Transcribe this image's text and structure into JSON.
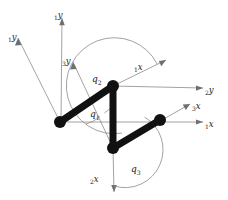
{
  "figure": {
    "kind": "kinematic-linkage-diagram",
    "background_color": "#ffffff",
    "link_color": "#111111",
    "axis_color": "#8a8a8a",
    "label_color": "#1a1a1a"
  },
  "joints": [
    {
      "name": "joint-left",
      "label": "",
      "x": 60,
      "y": 122
    },
    {
      "name": "joint-top",
      "label": "",
      "x": 113,
      "y": 86
    },
    {
      "name": "joint-bottom",
      "label": "",
      "x": 113,
      "y": 148
    },
    {
      "name": "joint-right",
      "label": "",
      "x": 160,
      "y": 120
    }
  ],
  "links": [
    {
      "name": "link-left-top",
      "from": "joint-left",
      "to": "joint-top"
    },
    {
      "name": "link-top-bottom",
      "from": "joint-top",
      "to": "joint-bottom"
    },
    {
      "name": "link-bottom-right",
      "from": "joint-bottom",
      "to": "joint-right"
    }
  ],
  "axes": [
    {
      "name": "axis-1y-diagonal",
      "sub": "1",
      "var": "y",
      "origin_x": 60,
      "origin_y": 122,
      "tip_x": 18,
      "tip_y": 38,
      "label_x": 8,
      "label_y": 34
    },
    {
      "name": "axis-1y-vertical",
      "sub": "1",
      "var": "y",
      "origin_x": 61,
      "origin_y": 122,
      "tip_x": 62,
      "tip_y": 18,
      "label_x": 56,
      "label_y": 14
    },
    {
      "name": "axis-3y",
      "sub": "3",
      "var": "y",
      "origin_x": 113,
      "origin_y": 148,
      "tip_x": 73,
      "tip_y": 62,
      "label_x": 64,
      "label_y": 58
    },
    {
      "name": "axis-1x-diagonal",
      "sub": "1",
      "var": "x",
      "origin_x": 113,
      "origin_y": 86,
      "tip_x": 166,
      "tip_y": 60,
      "label_x": 136,
      "label_y": 70
    },
    {
      "name": "axis-2y",
      "sub": "2",
      "var": "y",
      "origin_x": 113,
      "origin_y": 86,
      "tip_x": 203,
      "tip_y": 88,
      "label_x": 206,
      "label_y": 92
    },
    {
      "name": "axis-3x",
      "sub": "3",
      "var": "x",
      "origin_x": 113,
      "origin_y": 148,
      "tip_x": 190,
      "tip_y": 104,
      "label_x": 193,
      "label_y": 108
    },
    {
      "name": "axis-1x-horizontal",
      "sub": "1",
      "var": "x",
      "origin_x": 60,
      "origin_y": 122,
      "tip_x": 203,
      "tip_y": 122,
      "label_x": 206,
      "label_y": 126
    },
    {
      "name": "axis-2x",
      "sub": "2",
      "var": "x",
      "origin_x": 113,
      "origin_y": 148,
      "tip_x": 114,
      "tip_y": 192,
      "label_x": 93,
      "label_y": 181
    }
  ],
  "angles": [
    {
      "name": "angle-q1",
      "var": "q",
      "sub": "1",
      "label_x": 93,
      "label_y": 117,
      "vertex_x": 113,
      "vertex_y": 148,
      "radius": 34
    },
    {
      "name": "angle-q2",
      "var": "q",
      "sub": "2",
      "label_x": 95,
      "label_y": 82,
      "vertex_x": 113,
      "vertex_y": 86,
      "radius": 48
    },
    {
      "name": "angle-q3",
      "var": "q",
      "sub": "3",
      "label_x": 133,
      "label_y": 172,
      "vertex_x": 113,
      "vertex_y": 148,
      "radius": 38
    }
  ],
  "labels": {
    "axis_1y_diagonal": "y",
    "axis_1y_diagonal_sub": "1",
    "axis_1y_vertical": "y",
    "axis_1y_vertical_sub": "1",
    "axis_3y": "y",
    "axis_3y_sub": "3",
    "axis_1x_diagonal": "x",
    "axis_1x_diagonal_sub": "1",
    "axis_2y": "y",
    "axis_2y_sub": "2",
    "axis_3x": "x",
    "axis_3x_sub": "3",
    "axis_1x_horizontal": "x",
    "axis_1x_horizontal_sub": "1",
    "axis_2x": "x",
    "axis_2x_sub": "2",
    "angle_q1": "q",
    "angle_q1_sub": "1",
    "angle_q2": "q",
    "angle_q2_sub": "2",
    "angle_q3": "q",
    "angle_q3_sub": "3"
  }
}
